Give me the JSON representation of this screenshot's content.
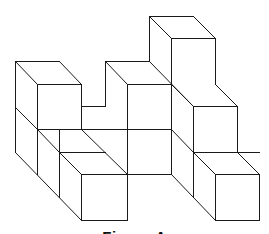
{
  "figure": {
    "caption": "Figure A",
    "stroke_color": "#1a1a1a",
    "background": "#ffffff",
    "lines": [
      [
        149,
        16,
        193,
        16
      ],
      [
        149,
        16,
        171,
        38
      ],
      [
        193,
        16,
        215,
        38
      ],
      [
        171,
        38,
        215,
        38
      ],
      [
        171,
        38,
        171,
        84
      ],
      [
        215,
        38,
        215,
        84
      ],
      [
        149,
        16,
        149,
        61
      ],
      [
        15,
        61,
        59,
        61
      ],
      [
        15,
        61,
        37,
        84
      ],
      [
        59,
        61,
        81,
        84
      ],
      [
        37,
        84,
        81,
        84
      ],
      [
        15,
        61,
        15,
        152
      ],
      [
        37,
        84,
        37,
        174
      ],
      [
        81,
        84,
        81,
        129
      ],
      [
        15,
        107,
        37,
        129
      ],
      [
        37,
        129,
        171,
        129
      ],
      [
        81,
        106,
        105,
        106
      ],
      [
        105,
        61,
        105,
        106
      ],
      [
        105,
        61,
        149,
        61
      ],
      [
        105,
        61,
        127,
        84
      ],
      [
        127,
        84,
        171,
        84
      ],
      [
        127,
        84,
        127,
        220
      ],
      [
        171,
        84,
        171,
        174
      ],
      [
        149,
        61,
        193,
        106
      ],
      [
        171,
        84,
        193,
        106
      ],
      [
        193,
        106,
        237,
        106
      ],
      [
        215,
        84,
        237,
        106
      ],
      [
        237,
        106,
        237,
        152
      ],
      [
        193,
        106,
        193,
        197
      ],
      [
        193,
        152,
        237,
        152
      ],
      [
        171,
        129,
        193,
        152
      ],
      [
        215,
        152,
        259,
        152
      ],
      [
        193,
        152,
        215,
        174
      ],
      [
        237,
        152,
        259,
        174
      ],
      [
        215,
        174,
        259,
        174
      ],
      [
        215,
        174,
        215,
        220
      ],
      [
        259,
        174,
        259,
        220
      ],
      [
        215,
        220,
        259,
        220
      ],
      [
        171,
        174,
        215,
        220
      ],
      [
        81,
        129,
        127,
        174
      ],
      [
        59,
        152,
        81,
        174
      ],
      [
        59,
        129,
        59,
        197
      ],
      [
        37,
        129,
        59,
        152
      ],
      [
        59,
        152,
        105,
        152
      ],
      [
        81,
        174,
        127,
        174
      ],
      [
        81,
        174,
        81,
        220
      ],
      [
        81,
        220,
        127,
        220
      ],
      [
        15,
        152,
        81,
        220
      ],
      [
        127,
        174,
        171,
        174
      ]
    ]
  }
}
